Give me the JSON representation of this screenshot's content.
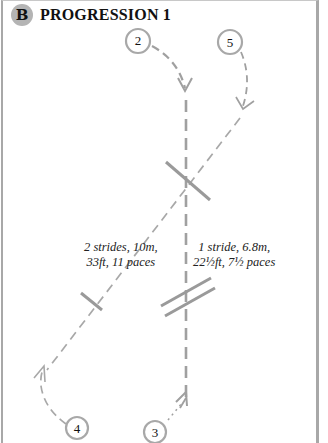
{
  "header": {
    "badge": "B",
    "title": "PROGRESSION 1"
  },
  "stops": [
    {
      "id": "stop-2",
      "label": "2"
    },
    {
      "id": "stop-5",
      "label": "5"
    },
    {
      "id": "stop-4",
      "label": "4"
    },
    {
      "id": "stop-3",
      "label": "3"
    }
  ],
  "distances": {
    "left": {
      "line1": "2 strides, 10m,",
      "line2": "33ft, 11 paces"
    },
    "right": {
      "line1": "1 stride, 6.8m,",
      "line2": "22½ft, 7½ paces"
    }
  },
  "colors": {
    "line": "#a0a0a0",
    "pole": "#9a9a9a",
    "badge_fill": "#b4b4b4",
    "text": "#111111"
  }
}
